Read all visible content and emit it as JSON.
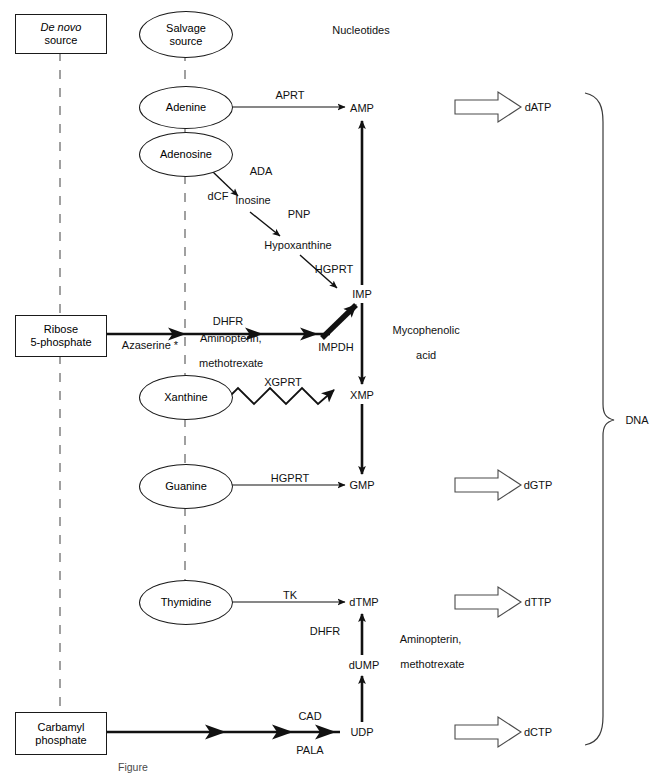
{
  "header": {
    "nucleotides_label": "Nucleotides",
    "dna_label": "DNA"
  },
  "sources": {
    "de_novo_line1": "De novo",
    "de_novo_line2": "source",
    "salvage_line1": "Salvage",
    "salvage_line2": "source"
  },
  "salvage_nodes": [
    {
      "label": "Adenine"
    },
    {
      "label": "Adenosine"
    },
    {
      "label": "Xanthine"
    },
    {
      "label": "Guanine"
    },
    {
      "label": "Thymidine"
    }
  ],
  "de_novo_nodes": [
    {
      "line1": "Ribose",
      "line2": "5-phosphate"
    },
    {
      "line1": "Carbamyl",
      "line2": "phosphate"
    }
  ],
  "intermediates": [
    {
      "label": "Inosine"
    },
    {
      "label": "Hypoxanthine"
    }
  ],
  "nucleotides": [
    {
      "label": "AMP"
    },
    {
      "label": "IMP"
    },
    {
      "label": "XMP"
    },
    {
      "label": "GMP"
    },
    {
      "label": "dTMP"
    },
    {
      "label": "dUMP"
    },
    {
      "label": "UDP"
    }
  ],
  "deoxynucleotides": [
    {
      "label": "dATP"
    },
    {
      "label": "dGTP"
    },
    {
      "label": "dTTP"
    },
    {
      "label": "dCTP"
    }
  ],
  "enzymes": [
    {
      "label": "APRT"
    },
    {
      "label": "ADA"
    },
    {
      "label": "PNP"
    },
    {
      "label": "HGPRT"
    },
    {
      "label": "DHFR"
    },
    {
      "label": "IMPDH"
    },
    {
      "label": "XGPRT"
    },
    {
      "label": "HGPRT"
    },
    {
      "label": "TK"
    },
    {
      "label": "DHFR"
    },
    {
      "label": "CAD"
    }
  ],
  "inhibitors": [
    {
      "label": "dCF"
    },
    {
      "label": "Azaserine *"
    },
    {
      "line1": "Aminopterin,",
      "line2": "methotrexate"
    },
    {
      "line1": "Mycophenolic",
      "line2": "acid"
    },
    {
      "line1": "Aminopterin,",
      "line2": "methotrexate"
    },
    {
      "label": "PALA"
    }
  ],
  "caption": {
    "text": "Figure"
  },
  "colors": {
    "stroke": "#1a1a1a",
    "text": "#111111",
    "background": "#ffffff"
  }
}
